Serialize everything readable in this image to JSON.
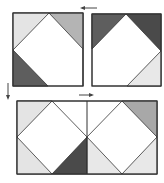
{
  "colors": {
    "light": "#e4e4e4",
    "medium": "#b4b4b4",
    "dark": "#5e5e5e",
    "darker": "#4a4a4a",
    "white": "#ffffff",
    "outline": "#333333",
    "arrow": "#444444"
  },
  "blocks": [
    {
      "name": "block-top-left",
      "x": 13,
      "y": 13,
      "w": 70,
      "h": 73,
      "triangles": [
        {
          "corner": "top-left",
          "fill": "light"
        },
        {
          "corner": "top-right",
          "fill": "medium"
        },
        {
          "corner": "bottom-left",
          "fill": "dark"
        }
      ],
      "apex": {
        "top_x": 49,
        "left_y": 50
      }
    },
    {
      "name": "block-top-right",
      "x": 92,
      "y": 14,
      "w": 69,
      "h": 72,
      "triangles": [
        {
          "corner": "top-left",
          "fill": "dark"
        },
        {
          "corner": "top-right",
          "fill": "darker"
        },
        {
          "corner": "bottom-right",
          "fill": "light"
        }
      ],
      "apex": {
        "top_x": 126,
        "right_y": 51
      }
    },
    {
      "name": "block-bottom-combined",
      "x": 17,
      "y": 101,
      "w": 140,
      "h": 73,
      "divider_x": 87,
      "mid_y": 137
    }
  ],
  "arrows": [
    {
      "name": "arrow-left",
      "direction": "left"
    },
    {
      "name": "arrow-down",
      "direction": "down"
    },
    {
      "name": "arrow-right",
      "direction": "right"
    }
  ]
}
